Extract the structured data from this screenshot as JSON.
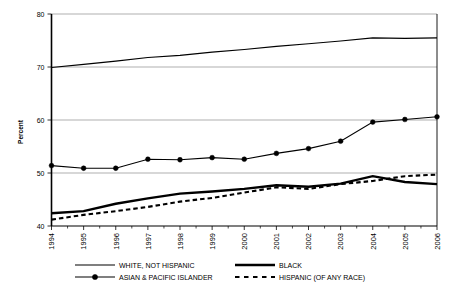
{
  "chart_data": {
    "type": "line",
    "title": "",
    "xlabel": "",
    "ylabel": "Percent",
    "ylim": [
      40,
      80
    ],
    "ytick_labels": [
      "40",
      "50",
      "60",
      "70",
      "80"
    ],
    "ytick_values": [
      40,
      50,
      60,
      70,
      80
    ],
    "grid": true,
    "grid_axis": "y",
    "legend_position": "bottom",
    "categories": [
      "1994",
      "1995",
      "1996",
      "1997",
      "1998",
      "1999",
      "2000",
      "2001",
      "2002",
      "2003",
      "2004",
      "2005",
      "2006"
    ],
    "series": [
      {
        "name": "WHITE, NOT HISPANIC",
        "style": "solid-thin",
        "marker": "none",
        "values": [
          69.9,
          70.5,
          71.1,
          71.8,
          72.2,
          72.8,
          73.3,
          73.9,
          74.4,
          74.9,
          75.5,
          75.4,
          75.5
        ]
      },
      {
        "name": "BLACK",
        "style": "solid-thick",
        "marker": "none",
        "values": [
          42.4,
          42.8,
          44.2,
          45.2,
          46.1,
          46.5,
          47.0,
          47.7,
          47.4,
          48.0,
          49.4,
          48.3,
          47.9
        ]
      },
      {
        "name": "ASIAN & PACIFIC ISLANDER",
        "style": "solid-thin-marker",
        "marker": "circle",
        "values": [
          51.4,
          50.9,
          50.9,
          52.6,
          52.5,
          52.9,
          52.6,
          53.7,
          54.6,
          56.0,
          59.6,
          60.1,
          60.6
        ]
      },
      {
        "name": "HISPANIC (OF ANY RACE)",
        "style": "dashed-thick",
        "marker": "none",
        "values": [
          41.2,
          42.1,
          42.8,
          43.6,
          44.6,
          45.3,
          46.3,
          47.3,
          47.0,
          47.9,
          48.5,
          49.4,
          49.7
        ]
      }
    ]
  },
  "axis": {
    "y_title": "Percent"
  },
  "legend": {
    "entries": [
      {
        "label": "WHITE, NOT HISPANIC",
        "style": "solid-thin"
      },
      {
        "label": "BLACK",
        "style": "solid-thick"
      },
      {
        "label": "ASIAN & PACIFIC ISLANDER",
        "style": "solid-thin-marker"
      },
      {
        "label": "HISPANIC (OF ANY RACE)",
        "style": "dashed-thick"
      }
    ]
  }
}
